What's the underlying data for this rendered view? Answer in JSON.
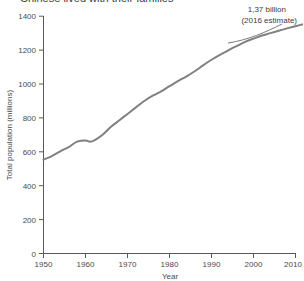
{
  "figure": {
    "title_fragment": "Chinese lived with their families",
    "background_color": "#ffffff"
  },
  "annotation": {
    "line1": "1,37 billion",
    "line2": "(2016 estimate)"
  },
  "axes": {
    "y_title": "Total population (millions)",
    "x_title": "Year",
    "y_ticks": [
      "0",
      "200",
      "400",
      "600",
      "800",
      "1000",
      "1200",
      "1400"
    ],
    "x_ticks": [
      "1950",
      "1960",
      "1970",
      "1980",
      "1990",
      "2000",
      "2010"
    ]
  },
  "chart_data": {
    "type": "line",
    "title": "Chinese lived with their families",
    "xlabel": "Year",
    "ylabel": "Total population (millions)",
    "xlim": [
      1950,
      2010
    ],
    "ylim": [
      0,
      1400
    ],
    "x_tick_values": [
      1950,
      1960,
      1970,
      1980,
      1990,
      2000,
      2010
    ],
    "y_tick_values": [
      0,
      200,
      400,
      600,
      800,
      1000,
      1200,
      1400
    ],
    "grid": false,
    "legend": "none",
    "line_color": "#808080",
    "line_width": 2,
    "annotations": [
      {
        "text": "1,37 billion (2016 estimate)",
        "value": 1370,
        "year": 2016,
        "leader": "curved"
      }
    ],
    "series": [
      {
        "name": "Total population (millions)",
        "x": [
          1950,
          1952,
          1954,
          1956,
          1958,
          1960,
          1961,
          1962,
          1964,
          1966,
          1968,
          1970,
          1972,
          1974,
          1976,
          1978,
          1980,
          1982,
          1984,
          1986,
          1988,
          1990,
          1992,
          1994,
          1996,
          1998,
          2000,
          2002,
          2004,
          2006,
          2008,
          2010,
          2012
        ],
        "y": [
          554,
          575,
          603,
          628,
          660,
          667,
          660,
          666,
          699,
          746,
          785,
          823,
          862,
          900,
          931,
          956,
          987,
          1017,
          1044,
          1075,
          1110,
          1143,
          1172,
          1199,
          1224,
          1248,
          1268,
          1286,
          1300,
          1314,
          1328,
          1341,
          1354
        ]
      }
    ]
  }
}
